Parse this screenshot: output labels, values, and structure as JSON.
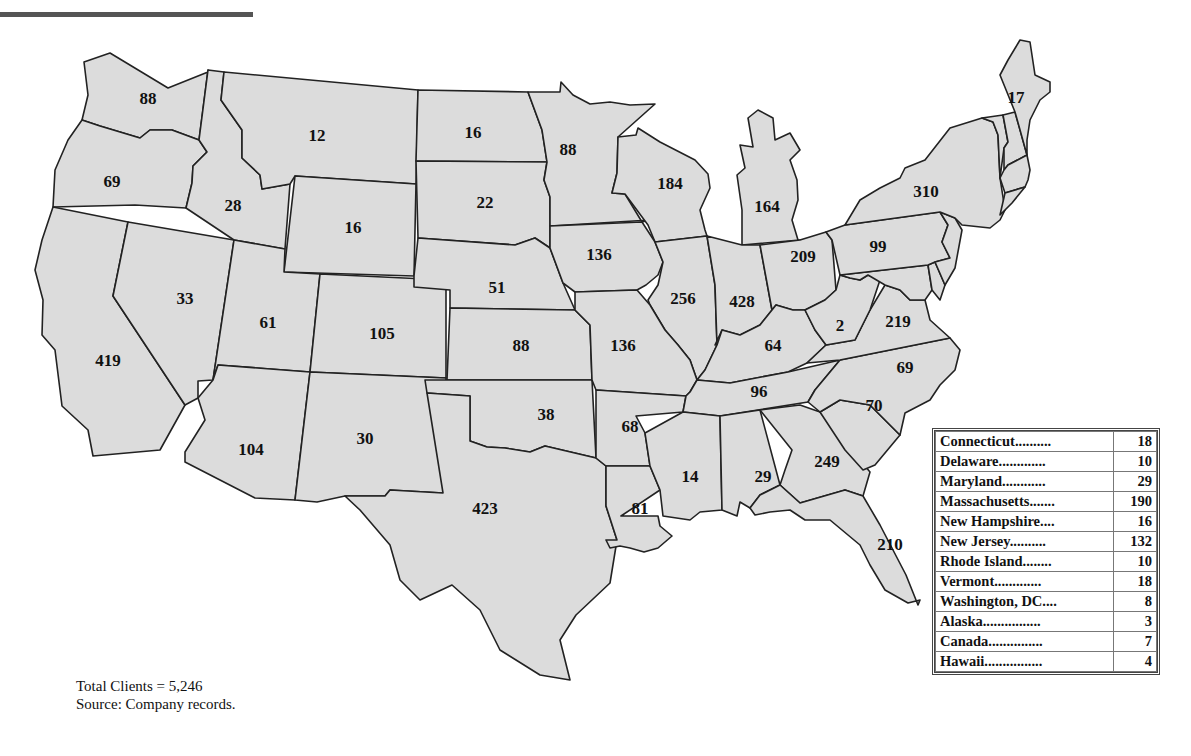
{
  "map": {
    "title": "Clients by State",
    "fill_color": "#dcdcdc",
    "stroke_color": "#222222",
    "states": [
      {
        "id": "WA",
        "name": "Washington",
        "value": "88",
        "x": 148,
        "y": 100
      },
      {
        "id": "OR",
        "name": "Oregon",
        "value": "69",
        "x": 112,
        "y": 183
      },
      {
        "id": "CA",
        "name": "California",
        "value": "419",
        "x": 108,
        "y": 362
      },
      {
        "id": "NV",
        "name": "Nevada",
        "value": "33",
        "x": 185,
        "y": 300
      },
      {
        "id": "ID",
        "name": "Idaho",
        "value": "28",
        "x": 233,
        "y": 207
      },
      {
        "id": "MT",
        "name": "Montana",
        "value": "12",
        "x": 317,
        "y": 137
      },
      {
        "id": "WY",
        "name": "Wyoming",
        "value": "16",
        "x": 353,
        "y": 229
      },
      {
        "id": "UT",
        "name": "Utah",
        "value": "61",
        "x": 268,
        "y": 324
      },
      {
        "id": "CO",
        "name": "Colorado",
        "value": "105",
        "x": 382,
        "y": 335
      },
      {
        "id": "AZ",
        "name": "Arizona",
        "value": "104",
        "x": 251,
        "y": 451
      },
      {
        "id": "NM",
        "name": "New Mexico",
        "value": "30",
        "x": 365,
        "y": 440
      },
      {
        "id": "ND",
        "name": "North Dakota",
        "value": "16",
        "x": 473,
        "y": 134
      },
      {
        "id": "SD",
        "name": "South Dakota",
        "value": "22",
        "x": 485,
        "y": 204
      },
      {
        "id": "NE",
        "name": "Nebraska",
        "value": "51",
        "x": 497,
        "y": 289
      },
      {
        "id": "KS",
        "name": "Kansas",
        "value": "88",
        "x": 521,
        "y": 347
      },
      {
        "id": "OK",
        "name": "Oklahoma",
        "value": "38",
        "x": 546,
        "y": 416
      },
      {
        "id": "TX",
        "name": "Texas",
        "value": "423",
        "x": 485,
        "y": 510
      },
      {
        "id": "MN",
        "name": "Minnesota",
        "value": "88",
        "x": 568,
        "y": 151
      },
      {
        "id": "IA",
        "name": "Iowa",
        "value": "136",
        "x": 599,
        "y": 256
      },
      {
        "id": "MO",
        "name": "Missouri",
        "value": "136",
        "x": 623,
        "y": 347
      },
      {
        "id": "AR",
        "name": "Arkansas",
        "value": "68",
        "x": 630,
        "y": 428
      },
      {
        "id": "LA",
        "name": "Louisiana",
        "value": "81",
        "x": 640,
        "y": 510
      },
      {
        "id": "WI",
        "name": "Wisconsin",
        "value": "184",
        "x": 670,
        "y": 185
      },
      {
        "id": "IL",
        "name": "Illinois",
        "value": "256",
        "x": 683,
        "y": 300
      },
      {
        "id": "MI",
        "name": "Michigan",
        "value": "164",
        "x": 767,
        "y": 208
      },
      {
        "id": "IN",
        "name": "Indiana",
        "value": "428",
        "x": 742,
        "y": 303
      },
      {
        "id": "OH",
        "name": "Ohio",
        "value": "209",
        "x": 803,
        "y": 258
      },
      {
        "id": "KY",
        "name": "Kentucky",
        "value": "64",
        "x": 773,
        "y": 347
      },
      {
        "id": "TN",
        "name": "Tennessee",
        "value": "96",
        "x": 759,
        "y": 393
      },
      {
        "id": "MS",
        "name": "Mississippi",
        "value": "14",
        "x": 690,
        "y": 478
      },
      {
        "id": "AL",
        "name": "Alabama",
        "value": "29",
        "x": 763,
        "y": 478
      },
      {
        "id": "GA",
        "name": "Georgia",
        "value": "249",
        "x": 827,
        "y": 463
      },
      {
        "id": "FL",
        "name": "Florida",
        "value": "210",
        "x": 890,
        "y": 546
      },
      {
        "id": "SC",
        "name": "South Carolina",
        "value": "70",
        "x": 874,
        "y": 407
      },
      {
        "id": "NC",
        "name": "North Carolina",
        "value": "69",
        "x": 905,
        "y": 369
      },
      {
        "id": "VA",
        "name": "Virginia",
        "value": "219",
        "x": 898,
        "y": 323
      },
      {
        "id": "WV",
        "name": "West Virginia",
        "value": "2",
        "x": 840,
        "y": 327
      },
      {
        "id": "PA",
        "name": "Pennsylvania",
        "value": "99",
        "x": 878,
        "y": 248
      },
      {
        "id": "NY",
        "name": "New York",
        "value": "310",
        "x": 926,
        "y": 193
      },
      {
        "id": "ME",
        "name": "Maine",
        "value": "17",
        "x": 1016,
        "y": 99
      }
    ]
  },
  "legend": {
    "rows": [
      {
        "label": "Connecticut..........",
        "value": "18"
      },
      {
        "label": "Delaware.............",
        "value": "10"
      },
      {
        "label": "Maryland............",
        "value": "29"
      },
      {
        "label": "Massachusetts.......",
        "value": "190"
      },
      {
        "label": "New Hampshire....",
        "value": "16"
      },
      {
        "label": "New Jersey..........",
        "value": "132"
      },
      {
        "label": "Rhode Island........",
        "value": "10"
      },
      {
        "label": "Vermont.............",
        "value": "18"
      },
      {
        "label": "Washington, DC....",
        "value": "8"
      },
      {
        "label": "Alaska................",
        "value": "3"
      },
      {
        "label": "Canada...............",
        "value": "7"
      },
      {
        "label": "Hawaii................",
        "value": "4"
      }
    ]
  },
  "footer": {
    "total": "Total Clients = 5,246",
    "source": "Source: Company records."
  }
}
